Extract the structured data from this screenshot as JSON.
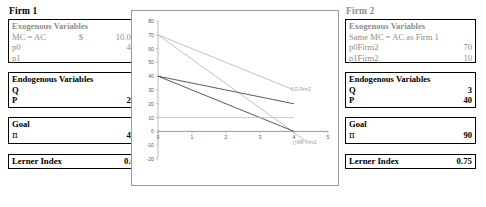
{
  "firm1": {
    "title": "Firm 1",
    "exogenous": {
      "header": "Exogenous Variables",
      "rows": [
        {
          "label": "MC = AC",
          "mid": "$",
          "value": "10.00"
        },
        {
          "label": "p0",
          "mid": "",
          "value": "40"
        },
        {
          "label": "p1",
          "mid": "",
          "value": "5"
        }
      ]
    },
    "endogenous": {
      "header": "Endogenous Variables",
      "rows": [
        {
          "label": "Q",
          "value": "3"
        },
        {
          "label": "P",
          "value": "25"
        }
      ]
    },
    "goal": {
      "header": "Goal",
      "rows": [
        {
          "label": "π",
          "value": "45"
        }
      ]
    },
    "lerner": {
      "label": "Lerner Index",
      "value": "0.6"
    }
  },
  "firm2": {
    "title": "Firm 2",
    "exogenous": {
      "header": "Exogenous Variables",
      "rows": [
        {
          "label": "Same MC = AC as Firm 1",
          "mid": "",
          "value": ""
        },
        {
          "label": "p0Firm2",
          "mid": "",
          "value": "70"
        },
        {
          "label": "p1Firm2",
          "mid": "",
          "value": "10"
        }
      ]
    },
    "endogenous": {
      "header": "Endogenous Variables",
      "rows": [
        {
          "label": "Q",
          "value": "3"
        },
        {
          "label": "P",
          "value": "40"
        }
      ]
    },
    "goal": {
      "header": "Goal",
      "rows": [
        {
          "label": "π",
          "value": "90"
        }
      ]
    },
    "lerner": {
      "label": "Lerner Index",
      "value": "0.75"
    }
  },
  "chart_data": {
    "type": "line",
    "title": "",
    "xlabel": "",
    "ylabel": "",
    "xlim": [
      0,
      5
    ],
    "ylim": [
      -20,
      80
    ],
    "ytick_labels": [
      "80",
      "70",
      "60",
      "50",
      "40",
      "30",
      "20",
      "10",
      "0",
      "-10",
      "-20"
    ],
    "ytick_values": [
      80,
      70,
      60,
      50,
      40,
      30,
      20,
      10,
      0,
      -10,
      -20
    ],
    "xtick_labels": [
      "0",
      "1",
      "2",
      "3",
      "4",
      "5"
    ],
    "xtick_values": [
      0,
      1,
      2,
      3,
      4,
      5
    ],
    "grid": false,
    "legend": "inline-labels",
    "series": [
      {
        "name": "D Firm2",
        "label": "D Firm2",
        "color": "#a6a6a6",
        "width": 0.7,
        "points": [
          [
            0,
            70
          ],
          [
            4,
            30
          ]
        ],
        "label_at": [
          4.02,
          30
        ]
      },
      {
        "name": "MR Firm2",
        "label": "MR Firm2",
        "color": "#a6a6a6",
        "width": 0.7,
        "points": [
          [
            0,
            70
          ],
          [
            4.35,
            -7
          ]
        ],
        "label_at": [
          4.08,
          -9
        ]
      },
      {
        "name": "D Firm1",
        "label": "",
        "color": "#4a4a4a",
        "width": 0.9,
        "points": [
          [
            0,
            40
          ],
          [
            4,
            20
          ]
        ],
        "label_at": null
      },
      {
        "name": "MR Firm1",
        "label": "",
        "color": "#4a4a4a",
        "width": 0.9,
        "points": [
          [
            0,
            40
          ],
          [
            4,
            0
          ]
        ],
        "label_at": null
      },
      {
        "name": "MC = AC",
        "label": "",
        "color": "#b4b4b4",
        "width": 0.7,
        "points": [
          [
            0,
            10
          ],
          [
            4,
            10
          ]
        ],
        "label_at": null
      }
    ]
  }
}
